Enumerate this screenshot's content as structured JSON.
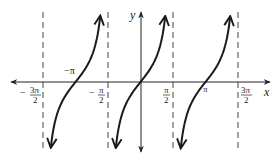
{
  "chart_data": {
    "type": "line",
    "title": "",
    "function": "y = tan(x)",
    "xlabel": "x",
    "ylabel": "y",
    "xlim": [
      -4.9,
      4.9
    ],
    "ylim": [
      -2.7,
      2.7
    ],
    "grid": false,
    "legend": null,
    "x_tick_labels": [
      {
        "value": -4.712,
        "label": "-3π/2",
        "num": "3π",
        "den": "2",
        "sign": "−"
      },
      {
        "value": -3.1416,
        "label": "-π",
        "num": "π",
        "den": "",
        "sign": "−"
      },
      {
        "value": -1.5708,
        "label": "-π/2",
        "num": "π",
        "den": "2",
        "sign": "−"
      },
      {
        "value": 1.5708,
        "label": "π/2",
        "num": "π",
        "den": "2",
        "sign": ""
      },
      {
        "value": 3.1416,
        "label": "π",
        "num": "π",
        "den": "",
        "sign": ""
      },
      {
        "value": 4.712,
        "label": "3π/2",
        "num": "3π",
        "den": "2",
        "sign": ""
      }
    ],
    "asymptotes": [
      -4.712,
      -1.5708,
      1.5708,
      4.712
    ],
    "zeros": [
      -3.1416,
      0,
      3.1416
    ],
    "branches": [
      {
        "center": -3.1416,
        "x_range": [
          -4.33,
          -1.95
        ]
      },
      {
        "center": 0,
        "x_range": [
          -1.19,
          1.19
        ]
      },
      {
        "center": 3.1416,
        "x_range": [
          1.95,
          4.33
        ]
      }
    ],
    "series": [
      {
        "name": "tan(x)",
        "x": [
          -1.19,
          -0.9,
          -0.6,
          -0.3,
          0,
          0.3,
          0.6,
          0.9,
          1.19
        ],
        "values": [
          -2.49,
          -1.26,
          -0.68,
          -0.31,
          0,
          0.31,
          0.68,
          1.26,
          2.49
        ]
      }
    ]
  },
  "labels": {
    "x_axis": "x",
    "y_axis": "y",
    "neg_pi": "−π",
    "pi": "π",
    "minus": "−",
    "three_pi": "3π",
    "pi_sym": "π",
    "two": "2"
  },
  "colors": {
    "curve": "#1a1a1a",
    "axis": "#222222",
    "asymptote": "#444444",
    "background": "#ffffff"
  }
}
